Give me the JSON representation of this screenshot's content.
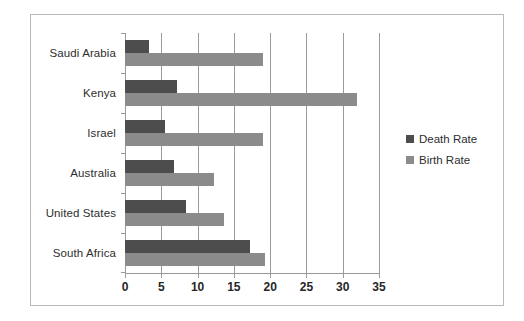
{
  "chart_data": {
    "type": "bar",
    "orientation": "horizontal",
    "title": "",
    "xlabel": "",
    "ylabel": "",
    "categories": [
      "South Africa",
      "United States",
      "Australia",
      "Israel",
      "Kenya",
      "Saudi Arabia"
    ],
    "series": [
      {
        "name": "Death Rate",
        "color": "#4d4d4d",
        "values": [
          17.2,
          8.4,
          6.8,
          5.5,
          7.2,
          3.3
        ]
      },
      {
        "name": "Birth Rate",
        "color": "#8b8b8b",
        "values": [
          19.3,
          13.7,
          12.2,
          19.0,
          32.0,
          19.0
        ]
      }
    ],
    "xlim": [
      0,
      35
    ],
    "xticks": [
      0,
      5,
      10,
      15,
      20,
      25,
      30,
      35
    ],
    "xtick_labels": [
      "0",
      "5",
      "10",
      "15",
      "20",
      "25",
      "30",
      "35"
    ],
    "grid": true,
    "grid_axis": "x",
    "legend_position": "right",
    "legend_entries": [
      "Death Rate",
      "Birth Rate"
    ]
  },
  "frame": {
    "border_color": "#b9b9b9",
    "background": "#ffffff"
  },
  "axis": {
    "line_color": "#9a9a9a",
    "label_color": "#262626"
  }
}
